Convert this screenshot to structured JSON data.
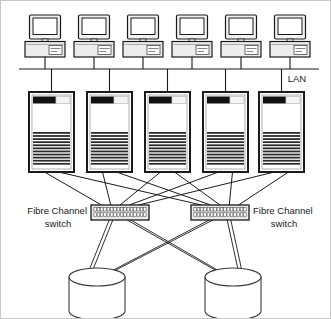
{
  "diagram": {
    "labels": {
      "lan": "LAN",
      "fc_switch_left_line1": "Fibre Channel",
      "fc_switch_left_line2": "switch",
      "fc_switch_right_line1": "Fibre Channel",
      "fc_switch_right_line2": "switch"
    },
    "colors": {
      "line": "#1a1a1a",
      "server_body": "#ffffff",
      "server_outline": "#1a1a1a",
      "server_topbar": "#111111",
      "server_vent": "#2b2b2b",
      "switch_body": "#e8e8e8",
      "switch_outline": "#1a1a1a",
      "storage_body": "#ffffff",
      "storage_outline": "#3a3a3a",
      "monitor_body": "#f2f2f2",
      "monitor_screen": "#ffffff",
      "base_body": "#ececec",
      "background": "#ffffff",
      "border": "#c8c8c8"
    },
    "workstations": [
      {
        "id": "workstation-1",
        "x": 24,
        "y": 14
      },
      {
        "id": "workstation-2",
        "x": 73,
        "y": 14
      },
      {
        "id": "workstation-3",
        "x": 122,
        "y": 14
      },
      {
        "id": "workstation-4",
        "x": 171,
        "y": 14
      },
      {
        "id": "workstation-5",
        "x": 220,
        "y": 14
      },
      {
        "id": "workstation-6",
        "x": 269,
        "y": 14
      }
    ],
    "workstation_count": 6,
    "lan_bus": {
      "x1": 18,
      "x2": 318,
      "y": 68
    },
    "servers": [
      {
        "id": "server-1",
        "x": 28,
        "y": 91
      },
      {
        "id": "server-2",
        "x": 86,
        "y": 91
      },
      {
        "id": "server-3",
        "x": 144,
        "y": 91
      },
      {
        "id": "server-4",
        "x": 202,
        "y": 91
      },
      {
        "id": "server-5",
        "x": 258,
        "y": 91
      }
    ],
    "server_count": 5,
    "server_size": {
      "w": 45,
      "h": 80
    },
    "switches": [
      {
        "id": "fc-switch-left",
        "x": 90,
        "y": 204,
        "w": 58,
        "h": 15,
        "ports": 16
      },
      {
        "id": "fc-switch-right",
        "x": 190,
        "y": 204,
        "w": 58,
        "h": 15,
        "ports": 16
      }
    ],
    "switch_count": 2,
    "storage_arrays": [
      {
        "id": "storage-array-left",
        "cx": 96,
        "cy": 285
      },
      {
        "id": "storage-array-right",
        "cx": 232,
        "cy": 285
      }
    ],
    "storage_count": 2,
    "storage_size": {
      "rx": 28,
      "ry": 9,
      "h": 34
    }
  }
}
